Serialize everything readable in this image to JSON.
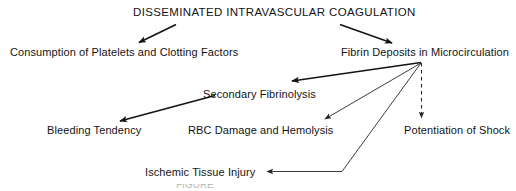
{
  "diagram": {
    "title": "DISSEMINATED INTRAVASCULAR COAGULATION",
    "nodes": {
      "title": "DISSEMINATED INTRAVASCULAR COAGULATION",
      "consumption": "Consumption of Platelets and Clotting Factors",
      "fibrin": "Fibrin Deposits in Microcirculation",
      "fibrinolysis": "Secondary Fibrinolysis",
      "bleeding": "Bleeding Tendency",
      "rbc": "RBC Damage and Hemolysis",
      "shock": "Potentiation of Shock",
      "ischemic": "Ischemic Tissue Injury"
    },
    "edges": [
      {
        "from": "title",
        "to": "consumption",
        "style": "solid-thick"
      },
      {
        "from": "title",
        "to": "fibrin",
        "style": "solid-thick"
      },
      {
        "from": "fibrin",
        "to": "fibrinolysis",
        "style": "solid-thick"
      },
      {
        "from": "fibrinolysis",
        "to": "bleeding",
        "style": "solid-thick"
      },
      {
        "from": "fibrin",
        "to": "rbc",
        "style": "solid-thin"
      },
      {
        "from": "fibrin",
        "to": "ischemic",
        "style": "solid-thin-elbow"
      },
      {
        "from": "fibrin",
        "to": "shock",
        "style": "dashed-thin"
      }
    ],
    "caption": "FIGURE",
    "colors": {
      "ink": "#141414",
      "line": "#1a1a1a",
      "background": "#ffffff",
      "caption": "#b9b9b9"
    }
  }
}
